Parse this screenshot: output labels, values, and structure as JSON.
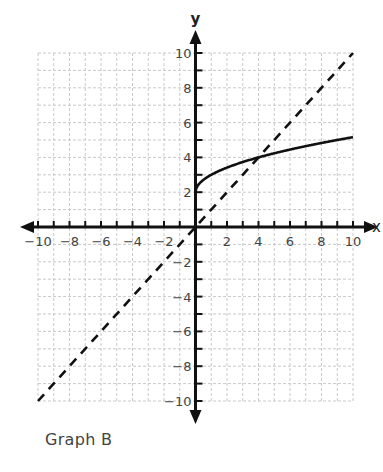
{
  "caption": "Graph B",
  "chart_data": {
    "type": "line",
    "title": "",
    "xlabel": "x",
    "ylabel": "y",
    "xlim": [
      -10,
      10
    ],
    "ylim": [
      -10,
      10
    ],
    "grid": true,
    "grid_step": 1,
    "xticks": [
      -10,
      -8,
      -6,
      -4,
      -2,
      2,
      4,
      6,
      8,
      10
    ],
    "yticks": [
      -10,
      -8,
      -6,
      -4,
      -2,
      2,
      4,
      6,
      8,
      10
    ],
    "xtick_labels": [
      "−10",
      "−8",
      "−6",
      "−4",
      "−2",
      "2",
      "4",
      "6",
      "8",
      "10"
    ],
    "ytick_labels": [
      "−10",
      "−8",
      "−6",
      "−4",
      "−2",
      "2",
      "4",
      "6",
      "8",
      "10"
    ],
    "series": [
      {
        "name": "curve",
        "style": "solid",
        "equation": "y = sqrt(x) + 2",
        "x": [
          0,
          0.25,
          1,
          2,
          4,
          6,
          8,
          9,
          10
        ],
        "y": [
          2,
          2.5,
          3,
          3.41,
          4,
          4.45,
          4.83,
          5,
          5.16
        ]
      },
      {
        "name": "line y = x",
        "style": "dashed",
        "equation": "y = x",
        "x": [
          -10,
          10
        ],
        "y": [
          -10,
          10
        ]
      }
    ],
    "annotations": [
      "Graph B"
    ]
  }
}
